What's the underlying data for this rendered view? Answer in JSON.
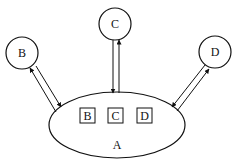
{
  "diagram": {
    "central_node": {
      "label": "A",
      "shape": "ellipse",
      "inner_boxes": [
        "B",
        "C",
        "D"
      ]
    },
    "outer_nodes": [
      {
        "id": "B",
        "label": "B",
        "shape": "circle"
      },
      {
        "id": "C",
        "label": "C",
        "shape": "circle"
      },
      {
        "id": "D",
        "label": "D",
        "shape": "circle"
      }
    ],
    "connections": [
      {
        "between": [
          "A",
          "B"
        ],
        "direction": "bidirectional"
      },
      {
        "between": [
          "A",
          "C"
        ],
        "direction": "bidirectional"
      },
      {
        "between": [
          "A",
          "D"
        ],
        "direction": "bidirectional"
      }
    ],
    "colors": {
      "stroke": "#111111",
      "background": "#ffffff"
    }
  }
}
